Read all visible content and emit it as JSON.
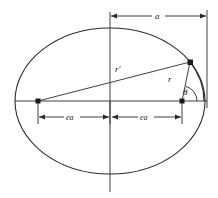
{
  "figure": {
    "labels": {
      "semi_major": "a",
      "focal_left": "ea",
      "focal_right": "ea",
      "radius_prime": "r'",
      "radius": "r",
      "angle": "θ"
    },
    "colors": {
      "stroke": "#2b2b2b",
      "text": "#1a1a1a",
      "background": "#ffffff"
    },
    "geometry": {
      "ellipse_center_x": 110,
      "ellipse_center_y": 101,
      "ellipse_rx": 95,
      "ellipse_ry": 73,
      "focus_left_x": 38,
      "focus_right_x": 182,
      "axis_y": 101,
      "point_p_x": 190,
      "point_p_y": 62,
      "right_reference_x": 207,
      "dimension_top_y": 16,
      "dimension_bottom_y": 117
    }
  }
}
